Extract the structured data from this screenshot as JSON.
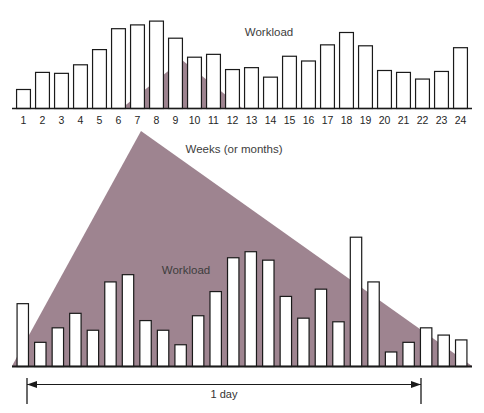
{
  "figure": {
    "title": "",
    "background": "#ffffff",
    "accent_color": "#9e8490",
    "bar_fill": "#ffffff",
    "bar_stroke": "#1a1a1a",
    "axis_color": "#1a1a1a"
  },
  "top": {
    "workload_label": "Workload",
    "axis_label": "Weeks (or months)",
    "tick_labels": [
      "1",
      "2",
      "3",
      "4",
      "5",
      "6",
      "7",
      "8",
      "9",
      "10",
      "11",
      "12",
      "13",
      "14",
      "15",
      "16",
      "17",
      "18",
      "19",
      "20",
      "21",
      "22",
      "23",
      "24"
    ]
  },
  "bottom": {
    "workload_label": "Workload",
    "span_label": "1 day"
  },
  "chart_data": [
    {
      "type": "bar",
      "id": "top-chart",
      "title": "Workload",
      "xlabel": "Weeks (or months)",
      "ylabel": "Workload",
      "grid": false,
      "legend": "none",
      "categories": [
        "1",
        "2",
        "3",
        "4",
        "5",
        "6",
        "7",
        "8",
        "9",
        "10",
        "11",
        "12",
        "13",
        "14",
        "15",
        "16",
        "17",
        "18",
        "19",
        "20",
        "21",
        "22",
        "23",
        "24"
      ],
      "values": [
        20,
        38,
        37,
        46,
        62,
        84,
        88,
        92,
        74,
        54,
        57,
        41,
        43,
        33,
        55,
        50,
        67,
        80,
        66,
        40,
        38,
        31,
        39,
        64
      ],
      "ylim": [
        0,
        100
      ],
      "overlay": {
        "type": "triangle",
        "color": "#9e8490",
        "description": "mauve triangle representing workload distribution, apex at week 10"
      }
    },
    {
      "type": "bar",
      "id": "bottom-chart",
      "title": "Workload",
      "xlabel": "1 day",
      "ylabel": "Workload",
      "grid": false,
      "legend": "none",
      "categories": [
        "1",
        "2",
        "3",
        "4",
        "5",
        "6",
        "7",
        "8",
        "9",
        "10",
        "11",
        "12",
        "13",
        "14",
        "15",
        "16",
        "17",
        "18",
        "19",
        "20",
        "21",
        "22",
        "23",
        "24",
        "25",
        "26"
      ],
      "values": [
        52,
        20,
        32,
        44,
        30,
        70,
        76,
        38,
        30,
        18,
        42,
        62,
        90,
        95,
        88,
        58,
        40,
        64,
        37,
        107,
        70,
        12,
        20,
        32,
        26,
        22
      ],
      "ylim": [
        0,
        120
      ],
      "overlay": {
        "type": "triangle",
        "color": "#9e8490",
        "description": "large mauve triangle spanning the full day, apex near left-center"
      }
    }
  ]
}
